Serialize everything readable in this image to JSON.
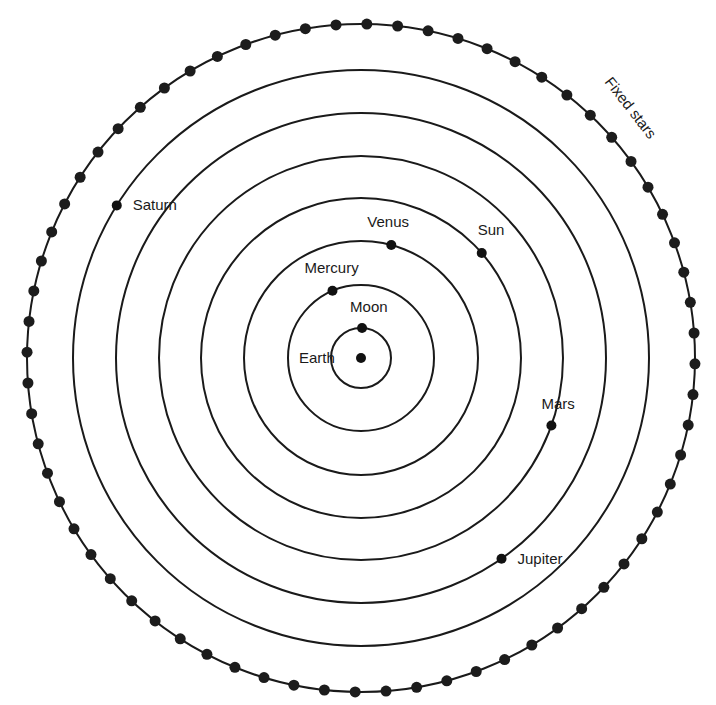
{
  "diagram": {
    "center": {
      "x": 361,
      "y": 358
    },
    "colors": {
      "ink": "#1a1a1a",
      "background": "#ffffff"
    },
    "bodies": [
      {
        "name": "Earth",
        "label": "Earth",
        "radius": 0,
        "angle_deg": 0,
        "label_dx": -62,
        "label_dy": 5
      },
      {
        "name": "Moon",
        "label": "Moon",
        "radius": 30,
        "angle_deg": 88,
        "label_dx": -12,
        "label_dy": -16
      },
      {
        "name": "Mercury",
        "label": "Mercury",
        "radius": 73,
        "angle_deg": 113,
        "label_dx": -28,
        "label_dy": -18
      },
      {
        "name": "Venus",
        "label": "Venus",
        "radius": 117,
        "angle_deg": 75,
        "label_dx": -24,
        "label_dy": -18
      },
      {
        "name": "Sun",
        "label": "Sun",
        "radius": 160,
        "angle_deg": 41,
        "label_dx": -4,
        "label_dy": -18
      },
      {
        "name": "Mars",
        "label": "Mars",
        "radius": 202,
        "angle_deg": -19.5,
        "label_dx": -10,
        "label_dy": -16
      },
      {
        "name": "Jupiter",
        "label": "Jupiter",
        "radius": 245,
        "angle_deg": -55,
        "label_dx": 16,
        "label_dy": 5
      },
      {
        "name": "Saturn",
        "label": "Saturn",
        "radius": 288,
        "angle_deg": -212,
        "label_dx": 16,
        "label_dy": 5
      }
    ],
    "fixed_stars": {
      "label": "Fixed stars",
      "radius": 334,
      "dot_count": 68,
      "start_angle_deg": 89
    }
  }
}
